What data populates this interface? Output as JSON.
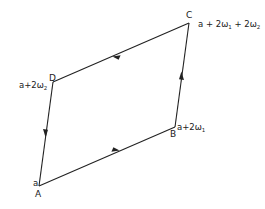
{
  "diagram": {
    "type": "period-parallelogram",
    "stroke_color": "#222222",
    "vertices": [
      {
        "id": "A",
        "label": "A",
        "value": "a",
        "x": 39,
        "y": 186
      },
      {
        "id": "B",
        "label": "B",
        "value": "a+2ω₁",
        "x": 175,
        "y": 127
      },
      {
        "id": "C",
        "label": "C",
        "value": "a + 2ω₁ + 2ω₂",
        "x": 189,
        "y": 23
      },
      {
        "id": "D",
        "label": "D",
        "value": "a+2ω₂",
        "x": 53,
        "y": 82
      }
    ],
    "edges": [
      {
        "from": "A",
        "to": "B",
        "arrow_direction": "A→B"
      },
      {
        "from": "B",
        "to": "C",
        "arrow_direction": "B→C"
      },
      {
        "from": "C",
        "to": "D",
        "arrow_direction": "C→D"
      },
      {
        "from": "D",
        "to": "A",
        "arrow_direction": "D→A"
      }
    ]
  },
  "labels": {
    "A": {
      "letter": "A",
      "value": "a"
    },
    "B": {
      "letter": "B",
      "value": "a+2ω",
      "sub": "1"
    },
    "C": {
      "letter": "C",
      "value_part1": "a + 2ω",
      "sub1": "1",
      "value_part2": " + 2ω",
      "sub2": "2"
    },
    "D": {
      "letter": "D",
      "value": "a+2ω",
      "sub": "2"
    }
  }
}
